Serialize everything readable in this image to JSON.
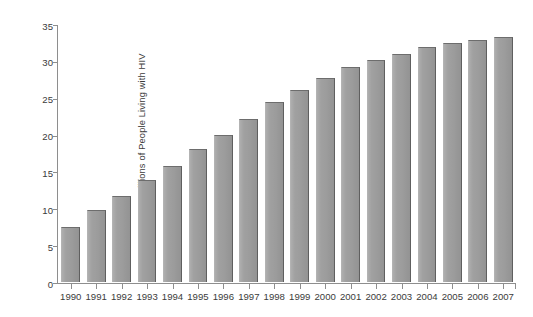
{
  "chart_data": {
    "type": "bar",
    "title": "",
    "xlabel": "",
    "ylabel": "Millions of People Living with HIV",
    "categories": [
      "1990",
      "1991",
      "1992",
      "1993",
      "1994",
      "1995",
      "1996",
      "1997",
      "1998",
      "1999",
      "2000",
      "2001",
      "2002",
      "2003",
      "2004",
      "2005",
      "2006",
      "2007"
    ],
    "values": [
      7.5,
      9.8,
      11.7,
      13.8,
      15.8,
      18.1,
      20.0,
      22.1,
      24.4,
      26.0,
      27.7,
      29.2,
      30.1,
      31.0,
      31.9,
      32.4,
      32.8,
      33.3
    ],
    "ylim": [
      0,
      35
    ],
    "yticks": [
      0,
      5,
      10,
      15,
      20,
      25,
      30,
      35
    ],
    "ytick_labels": [
      "0",
      "5",
      "10",
      "15",
      "20",
      "25",
      "30",
      "35"
    ],
    "grid": false,
    "legend": null,
    "bar_color": "#9c9c9c",
    "bar_edge_color": "#5f5f5f",
    "axis_color": "#8e8e8e",
    "background_color": "#ffffff",
    "text_color": "#3b3b3b"
  }
}
